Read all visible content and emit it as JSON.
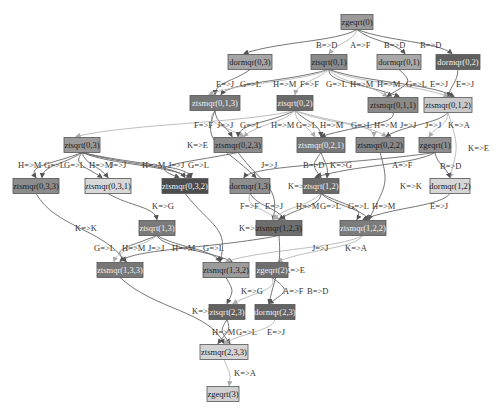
{
  "diagram": {
    "type": "task-dependency-graph",
    "nodes": [
      {
        "id": "zgeqrt(0)",
        "x": 357,
        "y": 22,
        "w": 32,
        "fill": "#9a9a9a",
        "text": "#222"
      },
      {
        "id": "dormqr(0,3)",
        "x": 250,
        "y": 62,
        "w": 44,
        "fill": "#a5a5a5",
        "text": "#222"
      },
      {
        "id": "ztsqrt(0,1)",
        "x": 329,
        "y": 62,
        "w": 36,
        "fill": "#8a8a8a",
        "text": "#222"
      },
      {
        "id": "dormqr(0,1)",
        "x": 399,
        "y": 62,
        "w": 44,
        "fill": "#a8a8a8",
        "text": "#222"
      },
      {
        "id": "dormqr(0,2)",
        "x": 458,
        "y": 62,
        "w": 44,
        "fill": "#606060",
        "text": "#eee"
      },
      {
        "id": "ztsmqr(0,1,3)",
        "x": 215,
        "y": 103,
        "w": 50,
        "fill": "#767676",
        "text": "#eee"
      },
      {
        "id": "ztsqrt(0,2)",
        "x": 295,
        "y": 103,
        "w": 36,
        "fill": "#6a6a6a",
        "text": "#eee"
      },
      {
        "id": "ztsmqr(0,1,1)",
        "x": 393,
        "y": 105,
        "w": 50,
        "fill": "#8a8a8a",
        "text": "#222"
      },
      {
        "id": "ztsmqr(0,1,2)",
        "x": 448,
        "y": 105,
        "w": 48,
        "fill": "#c9c9c9",
        "text": "#222"
      },
      {
        "id": "ztsqrt(0,3)",
        "x": 82,
        "y": 145,
        "w": 36,
        "fill": "#9a9a9a",
        "text": "#222"
      },
      {
        "id": "ztsmqr(0,2,3)",
        "x": 238,
        "y": 145,
        "w": 48,
        "fill": "#8c8c8c",
        "text": "#222"
      },
      {
        "id": "ztsmqr(0,2,1)",
        "x": 321,
        "y": 145,
        "w": 48,
        "fill": "#777777",
        "text": "#eee"
      },
      {
        "id": "ztsmqr(0,2,2)",
        "x": 380,
        "y": 145,
        "w": 48,
        "fill": "#878787",
        "text": "#222"
      },
      {
        "id": "zgeqrt(1)",
        "x": 435,
        "y": 145,
        "w": 32,
        "fill": "#8e8e8e",
        "text": "#222"
      },
      {
        "id": "ztsmqr(0,3,3)",
        "x": 36,
        "y": 186,
        "w": 46,
        "fill": "#8c8c8c",
        "text": "#222"
      },
      {
        "id": "ztsmqr(0,3,1)",
        "x": 108,
        "y": 186,
        "w": 46,
        "fill": "#d8d8d8",
        "text": "#222"
      },
      {
        "id": "ztsmqr(0,3,2)",
        "x": 185,
        "y": 186,
        "w": 46,
        "fill": "#4c4c4c",
        "text": "#eee"
      },
      {
        "id": "dormqr(1,3)",
        "x": 250,
        "y": 186,
        "w": 40,
        "fill": "#8e8e8e",
        "text": "#222"
      },
      {
        "id": "ztsqrt(1,2)",
        "x": 321,
        "y": 186,
        "w": 36,
        "fill": "#6a6a6a",
        "text": "#eee"
      },
      {
        "id": "dormqr(1,2)",
        "x": 450,
        "y": 186,
        "w": 40,
        "fill": "#d6d6d6",
        "text": "#222"
      },
      {
        "id": "ztsqrt(1,3)",
        "x": 157,
        "y": 228,
        "w": 36,
        "fill": "#7a7a7a",
        "text": "#eee"
      },
      {
        "id": "ztsmqr(1,2,3)",
        "x": 279,
        "y": 228,
        "w": 46,
        "fill": "#6e6e6e",
        "text": "#222"
      },
      {
        "id": "ztsmqr(1,2,2)",
        "x": 363,
        "y": 228,
        "w": 46,
        "fill": "#7c7c7c",
        "text": "#eee"
      },
      {
        "id": "ztsmqr(1,3,3)",
        "x": 120,
        "y": 270,
        "w": 46,
        "fill": "#777777",
        "text": "#eee"
      },
      {
        "id": "ztsmqr(1,3,2)",
        "x": 226,
        "y": 270,
        "w": 46,
        "fill": "#9c9c9c",
        "text": "#222"
      },
      {
        "id": "zgeqrt(2)",
        "x": 272,
        "y": 270,
        "w": 32,
        "fill": "#6e6e6e",
        "text": "#eee"
      },
      {
        "id": "ztsqrt(2,3)",
        "x": 227,
        "y": 312,
        "w": 36,
        "fill": "#626262",
        "text": "#eee"
      },
      {
        "id": "dormqr(2,3)",
        "x": 275,
        "y": 312,
        "w": 40,
        "fill": "#646464",
        "text": "#eee"
      },
      {
        "id": "ztsmqr(2,3,3)",
        "x": 224,
        "y": 352,
        "w": 48,
        "fill": "#d4d4d4",
        "text": "#222"
      },
      {
        "id": "zgeqrt(3)",
        "x": 223,
        "y": 394,
        "w": 32,
        "fill": "#d0d0d0",
        "text": "#222"
      }
    ],
    "edges": [
      {
        "from": "zgeqrt(0)",
        "to": "dormqr(0,3)",
        "label": "B=>D",
        "lx": 316,
        "ly": 45
      },
      {
        "from": "zgeqrt(0)",
        "to": "ztsqrt(0,1)",
        "label": "A=>F",
        "lx": 350,
        "ly": 45,
        "light": true
      },
      {
        "from": "zgeqrt(0)",
        "to": "dormqr(0,1)",
        "label": "B=>D",
        "lx": 384,
        "ly": 45
      },
      {
        "from": "zgeqrt(0)",
        "to": "dormqr(0,2)",
        "label": "B=>D",
        "lx": 420,
        "ly": 45
      },
      {
        "from": "dormqr(0,3)",
        "to": "ztsmqr(0,1,3)",
        "label": "E=>J",
        "lx": 216,
        "ly": 84
      },
      {
        "from": "ztsqrt(0,1)",
        "to": "ztsmqr(0,1,3)",
        "label": "G=>L",
        "lx": 240,
        "ly": 84
      },
      {
        "from": "ztsqrt(0,1)",
        "to": "ztsmqr(0,1,3)",
        "label": "H=>M",
        "lx": 273,
        "ly": 84,
        "light": true
      },
      {
        "from": "ztsqrt(0,1)",
        "to": "ztsqrt(0,2)",
        "label": "F=>F",
        "lx": 300,
        "ly": 84,
        "light": true
      },
      {
        "from": "ztsqrt(0,1)",
        "to": "ztsmqr(0,1,1)",
        "label": "G=>L",
        "lx": 326,
        "ly": 84
      },
      {
        "from": "ztsqrt(0,1)",
        "to": "ztsmqr(0,1,1)",
        "label": "H=>M",
        "lx": 350,
        "ly": 84,
        "light": true
      },
      {
        "from": "ztsqrt(0,1)",
        "to": "ztsmqr(0,1,2)",
        "label": "H=>M",
        "lx": 377,
        "ly": 84,
        "light": true
      },
      {
        "from": "ztsqrt(0,1)",
        "to": "ztsmqr(0,1,2)",
        "label": "G=>L",
        "lx": 406,
        "ly": 84
      },
      {
        "from": "dormqr(0,1)",
        "to": "ztsmqr(0,1,1)",
        "label": "E=>J",
        "lx": 430,
        "ly": 84
      },
      {
        "from": "dormqr(0,2)",
        "to": "ztsmqr(0,1,2)",
        "label": "E=>J",
        "lx": 456,
        "ly": 84
      },
      {
        "from": "ztsmqr(0,1,3)",
        "to": "ztsmqr(0,2,3)",
        "label": "F=>F",
        "lx": 194,
        "ly": 125,
        "light": true
      },
      {
        "from": "ztsmqr(0,1,3)",
        "to": "ztsmqr(0,2,3)",
        "label": "J=>J",
        "lx": 217,
        "ly": 125
      },
      {
        "from": "ztsqrt(0,2)",
        "to": "ztsmqr(0,2,3)",
        "label": "G=>L",
        "lx": 240,
        "ly": 125
      },
      {
        "from": "ztsqrt(0,2)",
        "to": "ztsmqr(0,2,3)",
        "label": "H=>M",
        "lx": 271,
        "ly": 125,
        "light": true
      },
      {
        "from": "ztsqrt(0,2)",
        "to": "ztsmqr(0,2,1)",
        "label": "G=>L",
        "lx": 296,
        "ly": 125,
        "light": true
      },
      {
        "from": "ztsqrt(0,2)",
        "to": "ztsmqr(0,2,1)",
        "label": "H=>M",
        "lx": 320,
        "ly": 125
      },
      {
        "from": "ztsqrt(0,2)",
        "to": "ztsmqr(0,2,2)",
        "label": "G=>L",
        "lx": 351,
        "ly": 125,
        "light": true
      },
      {
        "from": "ztsqrt(0,2)",
        "to": "ztsmqr(0,2,2)",
        "label": "H=>M",
        "lx": 374,
        "ly": 125,
        "light": true
      },
      {
        "from": "ztsmqr(0,1,1)",
        "to": "ztsmqr(0,2,1)",
        "label": "J=>J",
        "lx": 400,
        "ly": 125
      },
      {
        "from": "ztsmqr(0,1,2)",
        "to": "ztsmqr(0,2,2)",
        "label": "J=>J",
        "lx": 425,
        "ly": 125
      },
      {
        "from": "ztsmqr(0,1,2)",
        "to": "zgeqrt(1)",
        "label": "K=>A",
        "lx": 448,
        "ly": 125,
        "light": true
      },
      {
        "from": "ztsmqr(0,1,2)",
        "to": "dormqr(1,2)",
        "label": "K=>E",
        "lx": 468,
        "ly": 148,
        "light": true
      },
      {
        "from": "ztsmqr(0,1,3)",
        "to": "dormqr(1,3)",
        "label": "K=>E",
        "lx": 187,
        "ly": 145
      },
      {
        "from": "ztsqrt(0,2)",
        "to": "ztsqrt(0,3)",
        "label": "",
        "light": true
      },
      {
        "from": "ztsqrt(0,3)",
        "to": "ztsmqr(0,3,3)",
        "label": "H=>M",
        "lx": 18,
        "ly": 165
      },
      {
        "from": "ztsqrt(0,3)",
        "to": "ztsmqr(0,3,3)",
        "label": "G=>L",
        "lx": 44,
        "ly": 165
      },
      {
        "from": "ztsqrt(0,3)",
        "to": "ztsmqr(0,3,1)",
        "label": "G=>L",
        "lx": 64,
        "ly": 165
      },
      {
        "from": "ztsqrt(0,3)",
        "to": "ztsmqr(0,3,1)",
        "label": "H=>M",
        "lx": 89,
        "ly": 165
      },
      {
        "from": "ztsqrt(0,3)",
        "to": "ztsmqr(0,3,2)",
        "label": "H=>M",
        "lx": 142,
        "ly": 165
      },
      {
        "from": "ztsmqr(0,2,3)",
        "to": "ztsmqr(0,3,2)",
        "label": "J=>J",
        "lx": 110,
        "ly": 165
      },
      {
        "from": "ztsqrt(0,3)",
        "to": "ztsmqr(0,3,2)",
        "label": "J=>J",
        "lx": 168,
        "ly": 165
      },
      {
        "from": "ztsqrt(0,3)",
        "to": "ztsmqr(0,3,2)",
        "label": "G=>L",
        "lx": 188,
        "ly": 165
      },
      {
        "from": "zgeqrt(1)",
        "to": "dormqr(1,3)",
        "label": "J=>J",
        "lx": 261,
        "ly": 165
      },
      {
        "from": "ztsmqr(0,2,1)",
        "to": "ztsqrt(1,2)",
        "label": "B=>D",
        "lx": 303,
        "ly": 165
      },
      {
        "from": "ztsmqr(0,2,1)",
        "to": "ztsqrt(1,2)",
        "label": "K=>G",
        "lx": 330,
        "ly": 165
      },
      {
        "from": "zgeqrt(1)",
        "to": "ztsqrt(1,2)",
        "label": "A=>F",
        "lx": 392,
        "ly": 165
      },
      {
        "from": "zgeqrt(1)",
        "to": "dormqr(1,2)",
        "label": "B=>D",
        "lx": 440,
        "ly": 166
      },
      {
        "from": "ztsmqr(0,2,2)",
        "to": "ztsmqr(1,2,2)",
        "label": "K=>K",
        "lx": 400,
        "ly": 186
      },
      {
        "from": "ztsmqr(0,2,3)",
        "to": "ztsmqr(1,2,3)",
        "label": "K=>K",
        "lx": 288,
        "ly": 186
      },
      {
        "from": "ztsmqr(0,3,1)",
        "to": "ztsqrt(1,3)",
        "label": "K=>G",
        "lx": 152,
        "ly": 206
      },
      {
        "from": "ztsmqr(0,3,3)",
        "to": "ztsmqr(1,3,3)",
        "label": "K=>K",
        "lx": 75,
        "ly": 228
      },
      {
        "from": "ztsmqr(0,3,2)",
        "to": "ztsmqr(1,3,2)",
        "label": "K=>K",
        "lx": 239,
        "ly": 228
      },
      {
        "from": "dormqr(1,3)",
        "to": "ztsmqr(1,2,3)",
        "label": "F=>F",
        "lx": 240,
        "ly": 206,
        "light": true
      },
      {
        "from": "dormqr(1,3)",
        "to": "ztsmqr(1,2,3)",
        "label": "E=>J",
        "lx": 265,
        "ly": 206
      },
      {
        "from": "ztsqrt(1,2)",
        "to": "ztsmqr(1,2,3)",
        "label": "H=>M",
        "lx": 296,
        "ly": 206,
        "light": true
      },
      {
        "from": "ztsqrt(1,2)",
        "to": "ztsmqr(1,2,3)",
        "label": "G=>L",
        "lx": 320,
        "ly": 206
      },
      {
        "from": "ztsqrt(1,2)",
        "to": "ztsmqr(1,2,2)",
        "label": "G=>L",
        "lx": 348,
        "ly": 206
      },
      {
        "from": "ztsqrt(1,2)",
        "to": "ztsmqr(1,2,2)",
        "label": "H=>M",
        "lx": 372,
        "ly": 206
      },
      {
        "from": "dormqr(1,2)",
        "to": "ztsmqr(1,2,2)",
        "label": "E=>J",
        "lx": 430,
        "ly": 206
      },
      {
        "from": "ztsqrt(1,3)",
        "to": "ztsmqr(1,3,3)",
        "label": "G=>L",
        "lx": 94,
        "ly": 248
      },
      {
        "from": "ztsqrt(1,3)",
        "to": "ztsmqr(1,3,3)",
        "label": "H=>M",
        "lx": 122,
        "ly": 248,
        "light": true
      },
      {
        "from": "ztsmqr(1,2,3)",
        "to": "ztsmqr(1,3,3)",
        "label": "J=>J",
        "lx": 148,
        "ly": 248
      },
      {
        "from": "ztsqrt(1,3)",
        "to": "ztsmqr(1,3,2)",
        "label": "H=>M",
        "lx": 172,
        "ly": 248
      },
      {
        "from": "ztsqrt(1,3)",
        "to": "ztsmqr(1,3,2)",
        "label": "G=>L",
        "lx": 203,
        "ly": 248
      },
      {
        "from": "ztsmqr(1,2,2)",
        "to": "ztsmqr(1,3,2)",
        "label": "J=>J",
        "lx": 312,
        "ly": 248,
        "light": true
      },
      {
        "from": "ztsmqr(1,2,2)",
        "to": "zgeqrt(2)",
        "label": "K=>A",
        "lx": 345,
        "ly": 248,
        "light": true
      },
      {
        "from": "ztsmqr(1,2,3)",
        "to": "dormqr(2,3)",
        "label": "K=>E",
        "lx": 284,
        "ly": 270
      },
      {
        "from": "ztsmqr(1,3,2)",
        "to": "ztsqrt(2,3)",
        "label": "K=>G",
        "lx": 241,
        "ly": 291
      },
      {
        "from": "zgeqrt(2)",
        "to": "ztsqrt(2,3)",
        "label": "A=>F",
        "lx": 283,
        "ly": 291,
        "light": true
      },
      {
        "from": "zgeqrt(2)",
        "to": "dormqr(2,3)",
        "label": "B=>D",
        "lx": 307,
        "ly": 291
      },
      {
        "from": "ztsmqr(1,3,3)",
        "to": "ztsmqr(2,3,3)",
        "label": "K=>K",
        "lx": 192,
        "ly": 311
      },
      {
        "from": "ztsqrt(2,3)",
        "to": "ztsmqr(2,3,3)",
        "label": "H=>M",
        "lx": 212,
        "ly": 332
      },
      {
        "from": "ztsqrt(2,3)",
        "to": "ztsmqr(2,3,3)",
        "label": "G=>L",
        "lx": 236,
        "ly": 332
      },
      {
        "from": "dormqr(2,3)",
        "to": "ztsmqr(2,3,3)",
        "label": "E=>J",
        "lx": 267,
        "ly": 332,
        "light": true
      },
      {
        "from": "ztsmqr(2,3,3)",
        "to": "zgeqrt(3)",
        "label": "K=>A",
        "lx": 234,
        "ly": 373,
        "light": true
      }
    ]
  }
}
